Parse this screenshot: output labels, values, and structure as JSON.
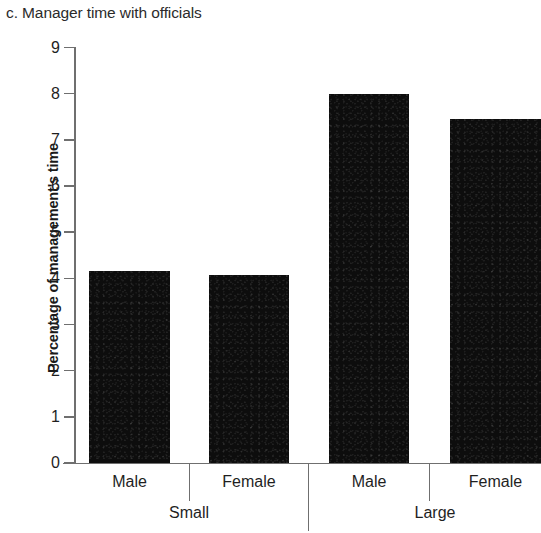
{
  "chart_data": {
    "type": "bar",
    "title": "c. Manager time with officials",
    "xlabel": "",
    "ylabel": "Percentage of management's time",
    "ylim": [
      0,
      9
    ],
    "ytick_labels": [
      "9",
      "8",
      "7",
      "6",
      "5",
      "4",
      "3",
      "2",
      "1",
      "0"
    ],
    "ytick_values": [
      9,
      8,
      7,
      6,
      5,
      4,
      3,
      2,
      1,
      0
    ],
    "grid": false,
    "legend": null,
    "group_labels": [
      "Small",
      "Large"
    ],
    "categories": [
      "Male",
      "Female",
      "Male",
      "Female"
    ],
    "values": [
      4.16,
      4.08,
      8.0,
      7.45
    ],
    "bars": [
      {
        "group": "Small",
        "category": "Male",
        "value": 4.16
      },
      {
        "group": "Small",
        "category": "Female",
        "value": 4.08
      },
      {
        "group": "Large",
        "category": "Male",
        "value": 8.0
      },
      {
        "group": "Large",
        "category": "Female",
        "value": 7.45
      }
    ],
    "bar_color": "#0d0d0d",
    "axis_color": "#6f6f6f"
  },
  "axis": {
    "y_labels": [
      "9",
      "8",
      "7",
      "6",
      "5",
      "4",
      "3",
      "2",
      "1",
      "0"
    ],
    "x_level1": [
      "Male",
      "Female",
      "Male",
      "Female"
    ],
    "x_level2": [
      "Small",
      "Large"
    ]
  }
}
